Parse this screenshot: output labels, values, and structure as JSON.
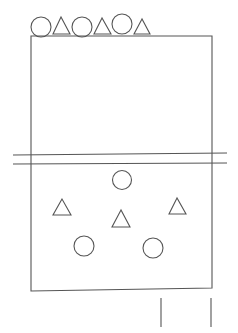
{
  "diagram": {
    "stroke_color": "#555555",
    "background": "#ffffff",
    "top_row": [
      {
        "shape": "circle"
      },
      {
        "shape": "triangle"
      },
      {
        "shape": "circle"
      },
      {
        "shape": "triangle"
      },
      {
        "shape": "circle"
      },
      {
        "shape": "triangle"
      }
    ],
    "lower_formation": [
      {
        "shape": "circle",
        "position": "top-center"
      },
      {
        "shape": "triangle",
        "position": "left"
      },
      {
        "shape": "triangle",
        "position": "center"
      },
      {
        "shape": "triangle",
        "position": "right"
      },
      {
        "shape": "circle",
        "position": "bottom-left"
      },
      {
        "shape": "circle",
        "position": "bottom-right"
      }
    ],
    "divider": "double-line",
    "posts": 2
  }
}
